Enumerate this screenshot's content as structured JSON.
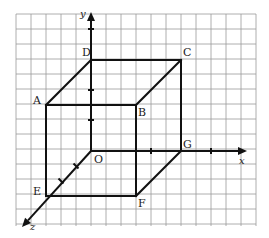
{
  "figure": {
    "grid": {
      "left": 16,
      "top": 14,
      "right": 256,
      "bottom": 226,
      "spacing": 15,
      "color": "#9a9a9a"
    },
    "line_color": "#111111",
    "axes": {
      "x": {
        "label": "x",
        "from": [
          91,
          151
        ],
        "to": [
          247,
          151
        ]
      },
      "y": {
        "label": "y",
        "from": [
          91,
          151
        ],
        "to": [
          91,
          12
        ]
      },
      "z": {
        "label": "z",
        "from": [
          91,
          151
        ],
        "to": [
          22,
          227
        ]
      }
    },
    "ticks": [
      [
        91,
        29
      ],
      [
        91,
        90
      ],
      [
        91,
        120
      ],
      [
        151,
        151
      ],
      [
        211,
        151
      ],
      [
        76,
        166
      ],
      [
        61,
        181
      ]
    ],
    "vertices": {
      "O": {
        "label": "O",
        "pos": [
          91,
          151
        ],
        "label_pos": [
          94,
          163
        ]
      },
      "A": {
        "label": "A",
        "pos": [
          46,
          105
        ],
        "label_pos": [
          33,
          104
        ]
      },
      "B": {
        "label": "B",
        "pos": [
          136,
          105
        ],
        "label_pos": [
          138,
          116
        ]
      },
      "C": {
        "label": "C",
        "pos": [
          181,
          60
        ],
        "label_pos": [
          183,
          56
        ]
      },
      "D": {
        "label": "D",
        "pos": [
          91,
          60
        ],
        "label_pos": [
          82,
          56
        ]
      },
      "E": {
        "label": "E",
        "pos": [
          46,
          196
        ],
        "label_pos": [
          33,
          195
        ]
      },
      "F": {
        "label": "F",
        "pos": [
          136,
          196
        ],
        "label_pos": [
          138,
          207
        ]
      },
      "G": {
        "label": "G",
        "pos": [
          181,
          151
        ],
        "label_pos": [
          183,
          148
        ]
      }
    },
    "edges": [
      [
        "D",
        "C"
      ],
      [
        "A",
        "B"
      ],
      [
        "A",
        "D"
      ],
      [
        "B",
        "C"
      ],
      [
        "A",
        "E"
      ],
      [
        "B",
        "F"
      ],
      [
        "C",
        "G"
      ],
      [
        "E",
        "F"
      ],
      [
        "F",
        "G"
      ]
    ],
    "axis_label_positions": {
      "x": [
        239,
        164
      ],
      "y": [
        80,
        17
      ],
      "z": [
        30,
        230
      ]
    }
  }
}
